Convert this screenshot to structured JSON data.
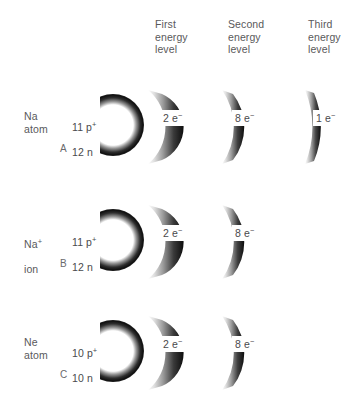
{
  "diagram": {
    "background_color": "#ffffff",
    "text_color": "#59595b",
    "shell_color_dark": "#111111",
    "shell_color_light": "#ffffff"
  },
  "columns": [
    {
      "id": "first",
      "label": "First\nenergy\nlevel",
      "x": 155
    },
    {
      "id": "second",
      "label": "Second\nenergy\nlevel",
      "x": 228
    },
    {
      "id": "third",
      "label": "Third\nenergy\nlevel",
      "x": 308
    }
  ],
  "rows": [
    {
      "letter": "A",
      "species": "Na\natom",
      "species_symbol": "Na",
      "species_kind": "atom",
      "charge": "",
      "nucleus": {
        "protons": "11 p",
        "protons_sign": "+",
        "neutrons": "12 n",
        "label": "11 p+\n12 n"
      },
      "shells": [
        {
          "level": "first",
          "label": "2 e",
          "sign": "−",
          "electrons": 2
        },
        {
          "level": "second",
          "label": "8 e",
          "sign": "−",
          "electrons": 8
        },
        {
          "level": "third",
          "label": "1 e",
          "sign": "−",
          "electrons": 1
        }
      ]
    },
    {
      "letter": "B",
      "species": "Na+\nion",
      "species_symbol": "Na",
      "species_kind": "ion",
      "charge": "+",
      "nucleus": {
        "protons": "11 p",
        "protons_sign": "+",
        "neutrons": "12 n",
        "label": "11 p+\n12 n"
      },
      "shells": [
        {
          "level": "first",
          "label": "2 e",
          "sign": "−",
          "electrons": 2
        },
        {
          "level": "second",
          "label": "8 e",
          "sign": "−",
          "electrons": 8
        }
      ]
    },
    {
      "letter": "C",
      "species": "Ne\natom",
      "species_symbol": "Ne",
      "species_kind": "atom",
      "charge": "",
      "nucleus": {
        "protons": "10 p",
        "protons_sign": "+",
        "neutrons": "10 n",
        "label": "10 p+\n10 n"
      },
      "shells": [
        {
          "level": "first",
          "label": "2 e",
          "sign": "−",
          "electrons": 2
        },
        {
          "level": "second",
          "label": "8 e",
          "sign": "−",
          "electrons": 8
        }
      ]
    }
  ]
}
